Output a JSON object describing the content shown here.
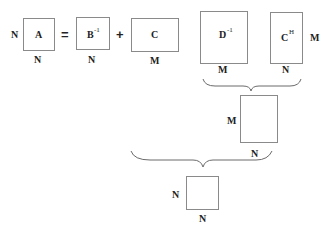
{
  "equation": {
    "operators": {
      "equals": "=",
      "plus": "+"
    },
    "matrices": {
      "A": {
        "label": "A",
        "sup": "",
        "rows": "N",
        "cols": "N"
      },
      "B": {
        "label": "B",
        "sup": "-1",
        "cols": "N"
      },
      "C": {
        "label": "C",
        "sup": "",
        "cols": "M"
      },
      "D": {
        "label": "D",
        "sup": "-1",
        "cols": "M"
      },
      "CH": {
        "label": "C",
        "sup": "H",
        "rows": "M",
        "cols": "N"
      },
      "product1": {
        "rows": "M",
        "cols": "N"
      },
      "product2": {
        "rows": "N",
        "cols": "N"
      }
    }
  }
}
